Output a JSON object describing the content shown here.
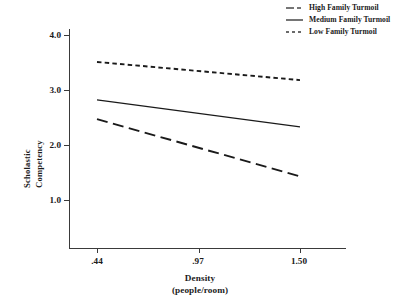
{
  "chart_data": {
    "type": "line",
    "title": "",
    "subtitle": "",
    "xlabel": "Density",
    "xlabel_units": "(people/room)",
    "ylabel_line1": "Scholastic",
    "ylabel_line2": "Competency",
    "x": [
      0.44,
      1.5
    ],
    "x_tick_labels": [
      ".44",
      ".97",
      "1.50"
    ],
    "x_tick_values": [
      0.44,
      0.97,
      1.5
    ],
    "y_tick_labels": [
      "4.0",
      "3.0",
      "2.0",
      "1.0"
    ],
    "y_tick_values": [
      4.0,
      3.0,
      2.0,
      1.0
    ],
    "xlim": [
      0.44,
      1.5
    ],
    "ylim": [
      0.5,
      4.2
    ],
    "grid": false,
    "legend_position": "top-right",
    "series": [
      {
        "name": "High Family Turmoil",
        "style": "dash-dot",
        "color": "#1a1a1a",
        "values": [
          2.47,
          1.43
        ]
      },
      {
        "name": "Medium Family Turmoil",
        "style": "solid",
        "color": "#1a1a1a",
        "values": [
          2.82,
          2.33
        ]
      },
      {
        "name": "Low Family Turmoil",
        "style": "dotted",
        "color": "#1a1a1a",
        "values": [
          3.51,
          3.18
        ]
      }
    ]
  },
  "legend": {
    "entries": [
      {
        "label": "High Family Turmoil",
        "sample": "dash-dot-line-sample"
      },
      {
        "label": "Medium Family Turmoil",
        "sample": "solid-line-sample"
      },
      {
        "label": "Low Family Turmoil",
        "sample": "dotted-line-sample"
      }
    ]
  },
  "axes": {
    "y_ticks": [
      "4.0",
      "3.0",
      "2.0",
      "1.0"
    ],
    "x_ticks": [
      ".44",
      ".97",
      "1.50"
    ]
  }
}
